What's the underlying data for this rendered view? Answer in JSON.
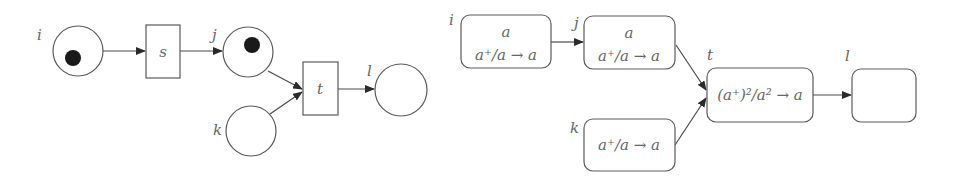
{
  "left_diagram": {
    "title": "Petri net",
    "places": [
      {
        "id": "i",
        "label": "i",
        "tokens": 1
      },
      {
        "id": "j",
        "label": "j",
        "tokens": 1
      },
      {
        "id": "k",
        "label": "k",
        "tokens": 0
      },
      {
        "id": "l",
        "label": "l",
        "tokens": 0
      }
    ],
    "transitions": [
      {
        "id": "s",
        "label": "s"
      },
      {
        "id": "t",
        "label": "t"
      }
    ],
    "arcs": [
      {
        "from": "i",
        "to": "s"
      },
      {
        "from": "s",
        "to": "j"
      },
      {
        "from": "j",
        "to": "t"
      },
      {
        "from": "k",
        "to": "t"
      },
      {
        "from": "t",
        "to": "l"
      }
    ]
  },
  "right_diagram": {
    "title": "Rewriting net",
    "nodes": [
      {
        "id": "i",
        "label": "i",
        "lines": [
          "a",
          "a⁺/a → a"
        ]
      },
      {
        "id": "j",
        "label": "j",
        "lines": [
          "a",
          "a⁺/a → a"
        ]
      },
      {
        "id": "k",
        "label": "k",
        "lines": [
          "a⁺/a → a"
        ]
      },
      {
        "id": "t",
        "label": "t",
        "lines": [
          "(a⁺)²/a² → a"
        ]
      },
      {
        "id": "l",
        "label": "l",
        "lines": []
      }
    ],
    "arcs": [
      {
        "from": "i",
        "to": "j"
      },
      {
        "from": "j",
        "to": "t"
      },
      {
        "from": "k",
        "to": "t"
      },
      {
        "from": "t",
        "to": "l"
      }
    ]
  },
  "colors": {
    "stroke": "#5a5a5a",
    "token": "#1a1a1a",
    "text": "#666666",
    "background": "#ffffff"
  }
}
